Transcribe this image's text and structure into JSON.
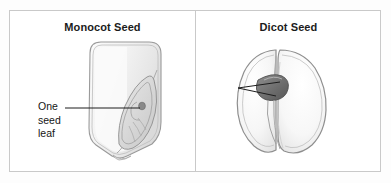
{
  "figure": {
    "background_color": "#fdfdfd",
    "frame_border_color": "#c9c9c9",
    "ink_color": "#151515",
    "panels": [
      {
        "id": "monocot",
        "title": "Monocot Seed",
        "callout": {
          "name": "one-seed-leaf",
          "text": "One\nseed\nleaf",
          "lines": [
            "One",
            "seed",
            "leaf"
          ],
          "leader_count": 1
        },
        "illustration": {
          "name": "monocot-seed-kernel",
          "description": "corn kernel with single cotyledon and embryo",
          "fill": "#f2f2f2",
          "outline": "#8e8e8e"
        }
      },
      {
        "id": "dicot",
        "title": "Dicot Seed",
        "callout": {
          "name": "two-seed-leaves",
          "text": "Two\nseed\nleaves",
          "lines": [
            "Two",
            "seed",
            "leaves"
          ],
          "leader_count": 2
        },
        "illustration": {
          "name": "dicot-seed-bean",
          "description": "bean seed split into two cotyledons with embryo",
          "fill": "#f4f4f4",
          "outline": "#8e8e8e"
        }
      }
    ]
  }
}
